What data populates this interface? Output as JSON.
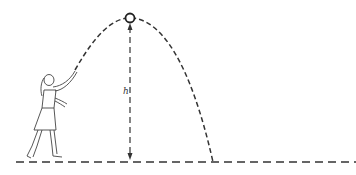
{
  "diagram": {
    "height_label": "h",
    "elements": [
      "person-throwing",
      "ball-at-apex",
      "trajectory-dashed-parabola",
      "height-arrow",
      "ground-line-dashed"
    ],
    "colors": {
      "stroke": "#333333",
      "background": "#ffffff"
    }
  }
}
